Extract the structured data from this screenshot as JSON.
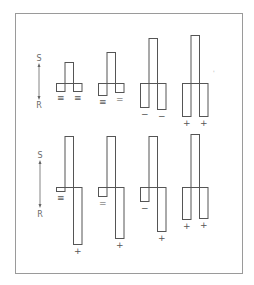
{
  "figure": {
    "axis": {
      "top_label": "S",
      "bottom_label": "R"
    },
    "stray_mark": "'",
    "rows": [
      {
        "name": "top-row",
        "panels": [
          {
            "stem_up": 21,
            "left_down": 8,
            "right_down": 8,
            "stem_down": 0,
            "left_up": 0,
            "right_up": 0,
            "left_sign": "≡",
            "right_sign": "≡"
          },
          {
            "stem_up": 31,
            "left_down": 12,
            "right_down": 9,
            "stem_down": 0,
            "left_up": 0,
            "right_up": 0,
            "left_sign": "≡",
            "right_sign": "="
          },
          {
            "stem_up": 45,
            "left_down": 24,
            "right_down": 26,
            "stem_down": 0,
            "left_up": 0,
            "right_up": 0,
            "left_sign": "−",
            "right_sign": "−"
          },
          {
            "stem_up": 48,
            "left_down": 33,
            "right_down": 33,
            "stem_down": 0,
            "left_up": 0,
            "right_up": 0,
            "left_sign": "+",
            "right_sign": "+"
          }
        ]
      },
      {
        "name": "bottom-row",
        "panels": [
          {
            "stem_up": 51,
            "left_down": 4,
            "right_down": 57,
            "left_sign": "≡",
            "right_sign": "+"
          },
          {
            "stem_up": 51,
            "left_down": 9,
            "right_down": 51,
            "left_sign": "=",
            "right_sign": "+"
          },
          {
            "stem_up": 51,
            "left_down": 14,
            "right_down": 44,
            "left_sign": "−",
            "right_sign": "+"
          },
          {
            "stem_up": 53,
            "left_down": 32,
            "right_down": 31,
            "left_sign": "+",
            "right_sign": "+"
          }
        ]
      }
    ]
  }
}
